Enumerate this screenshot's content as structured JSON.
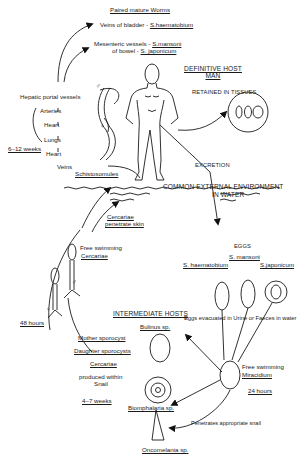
{
  "title": "Paired mature Worms",
  "worm_sites": {
    "bladder": {
      "label": "Veins of bladder -",
      "species": "S.haematobium"
    },
    "bowel": {
      "label_line1": "Mesenteric vessels -",
      "label_line2": "of bowel -",
      "species1": "S.mansoni",
      "species2": "S. japonicum"
    }
  },
  "migration_route": [
    "Hepatic portal vessels",
    "Arteries",
    "Heart",
    "Lungs",
    "Heart",
    "Veins"
  ],
  "migration_duration": "6–12 weeks",
  "schistosomules": "Schistosomules",
  "definitive_host": {
    "line1": "DEFINITIVE HOST",
    "line2": "MAN"
  },
  "retained": "RETAINED IN TISSUES",
  "excretion": "EXCRETION",
  "environment": {
    "line1": "COMMON EXTERNAL ENVIRONMENT",
    "line2": "IN WATER"
  },
  "cercariae_penetrate": {
    "line1": "Cercariae",
    "line2": "penetrate skin"
  },
  "free_swimming_cercariae": {
    "line1": "Free swimming",
    "line2": "Cercariae"
  },
  "sex_symbols": {
    "male": "♂",
    "female": "♀"
  },
  "eggs": {
    "heading": "EGGS",
    "species": [
      "S. haematobium",
      "S. mansoni",
      "S.japonicum"
    ],
    "evacuated": "Eggs evacuated in Urine or Faeces in water"
  },
  "intermediate_hosts": {
    "heading": "INTERMEDIATE HOSTS",
    "snails": [
      "Bulinus sp.",
      "Biomphalaria sp.",
      "Oncomelania sp."
    ]
  },
  "miracidium": {
    "line1": "Free swimming",
    "line2": "Miracidium",
    "duration": "24 hours"
  },
  "penetrates": "Penetrates appropriate snail",
  "cercariae_duration": "48 hours",
  "snail_stages": {
    "mother": "Mother sporocyst",
    "daughter": "Daughter sporocysts",
    "cercariae": "Cercariae",
    "produced_line1": "produced within",
    "produced_line2": "Snail",
    "duration": "4–7 weeks"
  }
}
